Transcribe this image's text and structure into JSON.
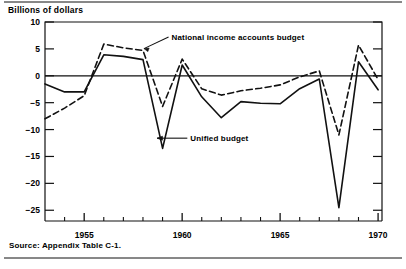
{
  "figure": {
    "axis_title": "Billions of dollars",
    "source": "Source: Appendix Table C-1.",
    "series_labels": {
      "nia": "National income accounts budget",
      "unified": "Unified budget"
    },
    "colors": {
      "ink": "#111111",
      "background": "#ffffff"
    }
  },
  "chart_data": {
    "type": "line",
    "title": "Billions of dollars",
    "xlabel": "",
    "ylabel": "Billions of dollars",
    "xlim": [
      1953,
      1970.2
    ],
    "ylim": [
      -27,
      10
    ],
    "yticks": [
      10,
      5,
      0,
      -5,
      -10,
      -15,
      -20,
      -25
    ],
    "ytick_labels": [
      "10",
      "5",
      "0",
      "-5",
      "-10",
      "-15",
      "-20",
      "-25"
    ],
    "xticks": [
      1955,
      1960,
      1965,
      1970
    ],
    "xtick_labels": [
      "1955",
      "1960",
      "1965",
      "1970"
    ],
    "x_minor_ticks": [
      1953,
      1954,
      1956,
      1957,
      1958,
      1959,
      1961,
      1962,
      1963,
      1964,
      1966,
      1967,
      1968,
      1969
    ],
    "grid": false,
    "zero_line": true,
    "legend": "inline-annotations",
    "annotations": [
      {
        "text": "National income accounts budget",
        "x": 1959.0,
        "y": 7.2
      },
      {
        "text": "Unified budget",
        "x": 1959.6,
        "y": -11.6
      }
    ],
    "x": [
      1953,
      1954,
      1955,
      1956,
      1957,
      1958,
      1959,
      1960,
      1961,
      1962,
      1963,
      1964,
      1965,
      1966,
      1967,
      1968,
      1969,
      1970
    ],
    "series": [
      {
        "name": "Unified budget",
        "style": "solid",
        "values": [
          -1.5,
          -3.0,
          -3.0,
          3.9,
          3.6,
          3.0,
          -13.5,
          2.0,
          -3.9,
          -7.8,
          -4.8,
          -5.1,
          -5.2,
          -2.4,
          -0.6,
          -24.5,
          2.6,
          -2.6
        ]
      },
      {
        "name": "National income accounts budget",
        "style": "dashed",
        "values": [
          -8.0,
          -6.0,
          -3.7,
          5.9,
          5.2,
          4.7,
          -5.7,
          3.1,
          -2.4,
          -3.6,
          -2.8,
          -2.3,
          -1.7,
          -0.2,
          0.9,
          -11.0,
          5.7,
          -0.7
        ]
      }
    ]
  }
}
